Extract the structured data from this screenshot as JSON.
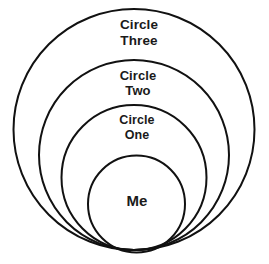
{
  "diagram": {
    "type": "concentric-circles",
    "background_color": "#ffffff",
    "stroke_color": "#111111",
    "text_color": "#1a1a1a",
    "canvas": {
      "width": 269,
      "height": 264
    },
    "rings": [
      {
        "id": "circle-three",
        "label": "Circle\nThree",
        "label_line_1": "Circle",
        "label_line_2": "Three",
        "level": 4,
        "center_x": 134,
        "center_y": 129.5,
        "radius": 120.5,
        "stroke_width": 2.0,
        "label_x": 139,
        "label_y": 17
      },
      {
        "id": "circle-two",
        "label": "Circle\nTwo",
        "label_line_1": "Circle",
        "label_line_2": "Two",
        "level": 3,
        "center_x": 134,
        "center_y": 155,
        "radius": 95,
        "stroke_width": 2.0,
        "label_x": 138,
        "label_y": 68
      },
      {
        "id": "circle-one",
        "label": "Circle\nOne",
        "label_line_1": "Circle",
        "label_line_2": "One",
        "level": 2,
        "center_x": 134,
        "center_y": 177.5,
        "radius": 72.5,
        "stroke_width": 2.0,
        "label_x": 137,
        "label_y": 113
      },
      {
        "id": "circle-me",
        "label": "Me",
        "label_line_1": "Me",
        "label_line_2": "",
        "level": 1,
        "center_x": 136.5,
        "center_y": 204,
        "radius": 48.5,
        "stroke_width": 2.0,
        "label_x": 137,
        "label_y": 192
      }
    ]
  }
}
